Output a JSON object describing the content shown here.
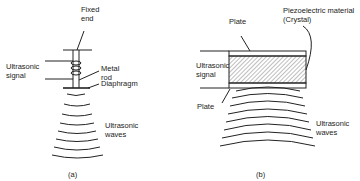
{
  "figure_a": {
    "caption": "(a)",
    "labels": {
      "fixed_end": "Fixed\nend",
      "signal": "Ultrasonic\nsignal",
      "rod": "Metal\nrod",
      "diaphragm": "Diaphragm",
      "waves": "Ultrasonic\nwaves"
    }
  },
  "figure_b": {
    "caption": "(b)",
    "labels": {
      "plate_top": "Plate",
      "crystal": "Piezoelectric material\n(Crystal)",
      "signal": "Ultrasonic\nsignal",
      "plate_bottom": "Plate",
      "waves": "Ultrasonic\nwaves"
    }
  },
  "colors": {
    "line": "#222222",
    "background": "#ffffff"
  }
}
